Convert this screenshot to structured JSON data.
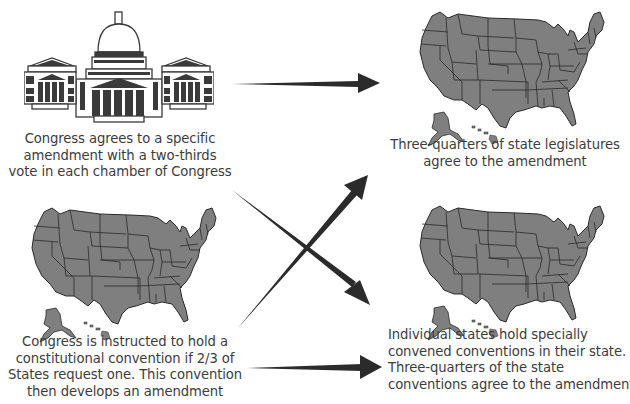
{
  "diagram": {
    "colors": {
      "map_fill": "#7f7f7f",
      "map_border": "#2a2a2a",
      "arrow": "#2b2b2b",
      "text": "#3c3c3c",
      "capitol_fill": "#3a3a3a"
    },
    "proposal_methods": [
      {
        "id": "congress",
        "icon": "capitol-building-icon",
        "caption_lines": [
          "Congress agrees to a specific",
          "amendment with a two-thirds",
          "vote in each chamber of Congress"
        ]
      },
      {
        "id": "convention",
        "icon": "us-map-icon",
        "caption_lines": [
          "Congress is instructed to hold a",
          "constitutional convention if 2/3 of",
          "States request one. This convention",
          "then develops an amendment"
        ]
      }
    ],
    "ratification_methods": [
      {
        "id": "legislatures",
        "icon": "us-map-icon",
        "caption_lines": [
          "Three-quarters of state legislatures",
          "agree to the amendment"
        ]
      },
      {
        "id": "state-conventions",
        "icon": "us-map-icon",
        "caption_lines": [
          "Individual states hold specially",
          "convened conventions in their state.",
          "Three-quarters of the state",
          "conventions agree to the amendment"
        ]
      }
    ],
    "arrows": [
      {
        "from": "congress",
        "to": "legislatures"
      },
      {
        "from": "congress",
        "to": "state-conventions"
      },
      {
        "from": "convention",
        "to": "legislatures"
      },
      {
        "from": "convention",
        "to": "state-conventions"
      }
    ]
  }
}
